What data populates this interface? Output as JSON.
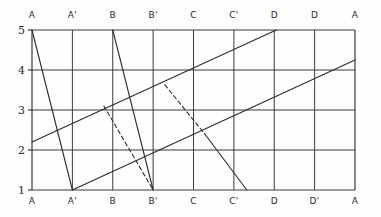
{
  "chart_data": {
    "type": "line",
    "title": "",
    "xlabel": "",
    "ylabel": "",
    "grid": true,
    "legend": false,
    "xlim": [
      0,
      8
    ],
    "ylim": [
      1,
      5
    ],
    "x_tick_labels_top": [
      "A",
      "A'",
      "B",
      "B'",
      "C",
      "C'",
      "D",
      "D",
      "A"
    ],
    "x_tick_labels_bottom": [
      "A",
      "A'",
      "B",
      "B'",
      "C",
      "C'",
      "D",
      "D'",
      "A"
    ],
    "y_tick_labels": [
      "5",
      "4",
      "3",
      "2",
      "1"
    ],
    "y_ticks": [
      5,
      4,
      3,
      2,
      1
    ],
    "x_ticks": [
      0,
      1,
      2,
      3,
      4,
      5,
      6,
      7,
      8
    ],
    "grid_color": "#3a3a3a",
    "line_color": "#2b2b2b",
    "series": [
      {
        "name": "descending-A-to-A-prime",
        "style": "solid",
        "points": [
          [
            0,
            5
          ],
          [
            1,
            1
          ]
        ]
      },
      {
        "name": "descending-B-to-B-prime",
        "style": "solid",
        "points": [
          [
            2,
            5
          ],
          [
            3,
            1
          ]
        ]
      },
      {
        "name": "descending-dashed-B-to-B-prime-lower",
        "style": "dashed",
        "points": [
          [
            1.78,
            3.1
          ],
          [
            3,
            1
          ]
        ]
      },
      {
        "name": "descending-dashed-to-C",
        "style": "dashed",
        "points": [
          [
            3.29,
            3.63
          ],
          [
            4.28,
            2.4
          ]
        ]
      },
      {
        "name": "descending-C-to-C-prime",
        "style": "solid",
        "points": [
          [
            4.28,
            2.4
          ],
          [
            5.32,
            1
          ]
        ]
      },
      {
        "name": "ascending-left-edge-to-D",
        "style": "solid",
        "points": [
          [
            0,
            2.2
          ],
          [
            6.05,
            5
          ]
        ]
      },
      {
        "name": "ascending-A-prime-to-right-edge",
        "style": "solid",
        "points": [
          [
            1,
            1
          ],
          [
            8,
            4.25
          ]
        ]
      }
    ]
  },
  "figure": {
    "border_color": "#555555"
  }
}
